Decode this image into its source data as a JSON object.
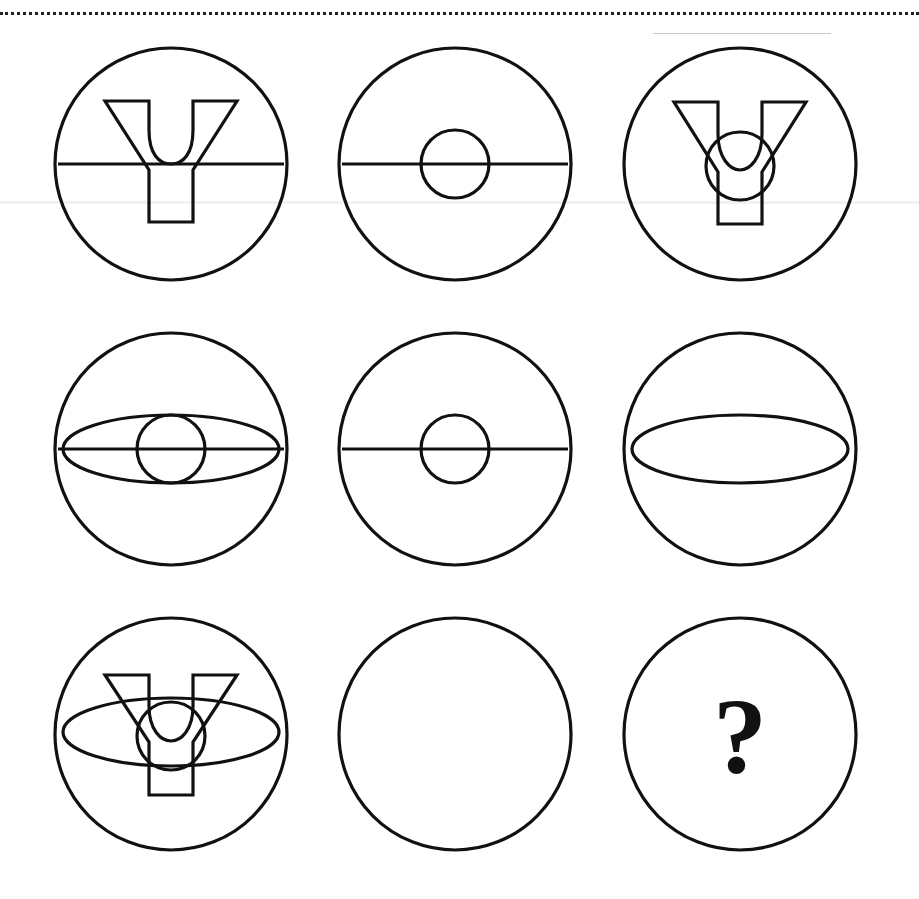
{
  "puzzle": {
    "type": "3x3 figure-reasoning matrix",
    "rows": 3,
    "cols": 3,
    "colors": {
      "stroke": "#111111",
      "background": "#ffffff"
    },
    "cells": [
      {
        "row": 1,
        "col": 1,
        "elements": [
          "outer-circle",
          "horizontal-line",
          "y-shape"
        ]
      },
      {
        "row": 1,
        "col": 2,
        "elements": [
          "outer-circle",
          "horizontal-line",
          "small-circle"
        ]
      },
      {
        "row": 1,
        "col": 3,
        "elements": [
          "outer-circle",
          "y-shape",
          "small-circle"
        ]
      },
      {
        "row": 2,
        "col": 1,
        "elements": [
          "outer-circle",
          "horizontal-line",
          "ellipse",
          "small-circle"
        ]
      },
      {
        "row": 2,
        "col": 2,
        "elements": [
          "outer-circle",
          "horizontal-line",
          "small-circle"
        ]
      },
      {
        "row": 2,
        "col": 3,
        "elements": [
          "outer-circle",
          "ellipse"
        ]
      },
      {
        "row": 3,
        "col": 1,
        "elements": [
          "outer-circle",
          "y-shape",
          "ellipse",
          "small-circle"
        ]
      },
      {
        "row": 3,
        "col": 2,
        "elements": [
          "outer-circle"
        ]
      },
      {
        "row": 3,
        "col": 3,
        "elements": [
          "outer-circle",
          "question-mark"
        ]
      }
    ],
    "question_mark": "?"
  }
}
